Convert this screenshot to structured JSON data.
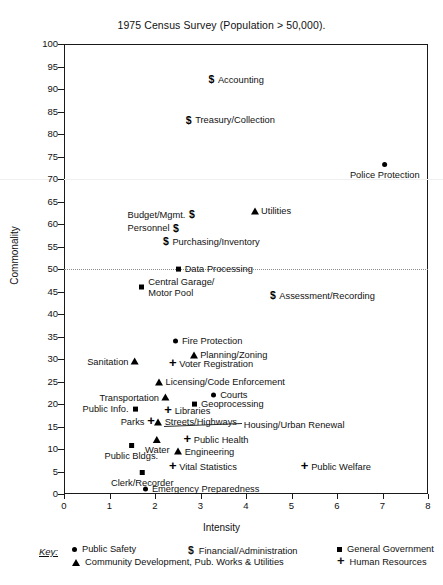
{
  "chart_data": {
    "type": "scatter",
    "title": "1975 Census Survey (Population > 50,000).",
    "xlabel": "Intensity",
    "ylabel": "Commonality",
    "xlim": [
      0,
      8
    ],
    "ylim": [
      0,
      100
    ],
    "xticks": [
      "0",
      "1",
      "2",
      "3",
      "4",
      "5",
      "6",
      "7",
      "8"
    ],
    "yticks": [
      "0",
      "5",
      "10",
      "15",
      "20",
      "25",
      "30",
      "35",
      "40",
      "45",
      "50",
      "55",
      "60",
      "65",
      "70",
      "75",
      "80",
      "85",
      "90",
      "95",
      "100"
    ],
    "grid": "dotted reference line at Commonality = 50",
    "legend_position": "below-plot",
    "series": [
      {
        "name": "Public Safety",
        "marker": "circle"
      },
      {
        "name": "Financial/Administration",
        "marker": "dollar"
      },
      {
        "name": "General Government",
        "marker": "square"
      },
      {
        "name": "Community Development, Pub. Works & Utilities",
        "marker": "triangle"
      },
      {
        "name": "Human Resources",
        "marker": "plus"
      }
    ],
    "points": [
      {
        "label": "Accounting",
        "marker": "dollar",
        "x": 3.25,
        "y": 92,
        "side": "rgt"
      },
      {
        "label": "Treasury/Collection",
        "marker": "dollar",
        "x": 2.75,
        "y": 83,
        "side": "rgt"
      },
      {
        "label": "Police Protection",
        "marker": "circle",
        "x": 7.05,
        "y": 74,
        "side": "below"
      },
      {
        "label": "Budget/Mgmt.",
        "marker": "dollar",
        "x": 2.8,
        "y": 62,
        "side": "lft"
      },
      {
        "label": "Utilities",
        "marker": "triangle",
        "x": 4.2,
        "y": 63,
        "side": "rgt"
      },
      {
        "label": "Personnel",
        "marker": "dollar",
        "x": 2.45,
        "y": 59,
        "side": "lft"
      },
      {
        "label": "Purchasing/Inventory",
        "marker": "dollar",
        "x": 2.25,
        "y": 56,
        "side": "rgt"
      },
      {
        "label": "Data Processing",
        "marker": "square",
        "x": 2.52,
        "y": 50,
        "side": "rgt"
      },
      {
        "label": "Central Garage/ Motor Pool",
        "marker": "square",
        "x": 1.72,
        "y": 46,
        "side": "rgt"
      },
      {
        "label": "Assessment/Recording",
        "marker": "dollar",
        "x": 4.6,
        "y": 44,
        "side": "rgt"
      },
      {
        "label": "Fire Protection",
        "marker": "circle",
        "x": 2.46,
        "y": 34,
        "side": "rgt"
      },
      {
        "label": "Planning/Zoning",
        "marker": "triangle",
        "x": 2.86,
        "y": 31,
        "side": "rgt"
      },
      {
        "label": "Sanitation",
        "marker": "triangle",
        "x": 1.55,
        "y": 29.5,
        "side": "lft"
      },
      {
        "label": "Voter Registration",
        "marker": "plus",
        "x": 2.4,
        "y": 29,
        "side": "rgt"
      },
      {
        "label": "Licensing/Code  Enforcement",
        "marker": "triangle",
        "x": 2.1,
        "y": 25,
        "side": "rgt"
      },
      {
        "label": "Transportation",
        "marker": "triangle",
        "x": 2.22,
        "y": 21.5,
        "side": "lft"
      },
      {
        "label": "Courts",
        "marker": "circle",
        "x": 3.3,
        "y": 22,
        "side": "rgt"
      },
      {
        "label": "Geoprocessing",
        "marker": "square",
        "x": 2.88,
        "y": 20,
        "side": "rgt"
      },
      {
        "label": "Public Info.",
        "marker": "square",
        "x": 1.55,
        "y": 19,
        "side": "lft"
      },
      {
        "label": "Libraries",
        "marker": "plus",
        "x": 2.3,
        "y": 18.5,
        "side": "rgt"
      },
      {
        "label": "Parks",
        "marker": "plus",
        "x": 1.9,
        "y": 16,
        "side": "lft"
      },
      {
        "label": "Streets/Highways",
        "marker": "triangle",
        "x": 2.08,
        "y": 16,
        "side": "rgt"
      },
      {
        "label": "Housing/Urban Renewal",
        "marker": "leader",
        "x": 3.95,
        "y": 15.5,
        "side": "rgt"
      },
      {
        "label": "Water",
        "marker": "triangle",
        "x": 2.05,
        "y": 13,
        "side": "below"
      },
      {
        "label": "Public Health",
        "marker": "plus",
        "x": 2.72,
        "y": 12,
        "side": "rgt"
      },
      {
        "label": "Public Bldgs.",
        "marker": "square",
        "x": 1.48,
        "y": 11.5,
        "side": "below"
      },
      {
        "label": "Engineering",
        "marker": "triangle",
        "x": 2.52,
        "y": 9.5,
        "side": "rgt"
      },
      {
        "label": "Vital  Statistics",
        "marker": "plus",
        "x": 2.4,
        "y": 6,
        "side": "rgt"
      },
      {
        "label": "Public Welfare",
        "marker": "plus",
        "x": 5.3,
        "y": 6,
        "side": "rgt"
      },
      {
        "label": "Clerk/Recorder",
        "marker": "square",
        "x": 1.72,
        "y": 5.5,
        "side": "below"
      },
      {
        "label": "Emergency Preparedness",
        "marker": "circle",
        "x": 1.8,
        "y": 1.2,
        "side": "rgt"
      }
    ]
  },
  "legend": {
    "key_word": "Key:",
    "items": [
      {
        "label": "Public Safety",
        "marker": "circle"
      },
      {
        "label": "Financial/Administration",
        "marker": "dollar"
      },
      {
        "label": "General Government",
        "marker": "square"
      },
      {
        "label": "Community Development, Pub. Works & Utilities",
        "marker": "triangle"
      },
      {
        "label": "Human Resources",
        "marker": "plus"
      }
    ]
  }
}
